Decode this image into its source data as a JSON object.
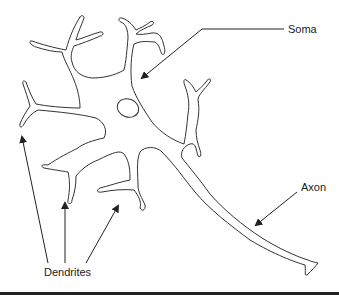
{
  "diagram": {
    "labels": {
      "soma": "Soma",
      "axon": "Axon",
      "dendrites": "Dendrites"
    },
    "colors": {
      "line": "#333333",
      "text": "#222222",
      "rule": "#222222",
      "background": "#ffffff"
    }
  }
}
